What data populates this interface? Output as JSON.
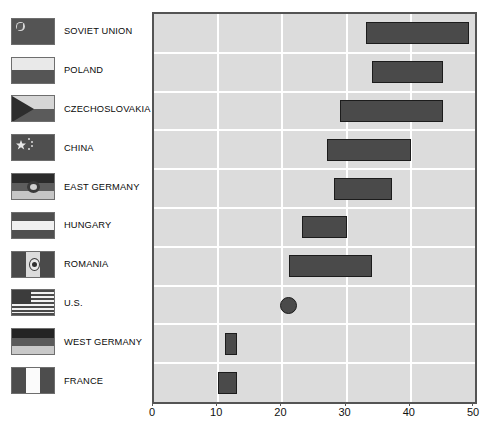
{
  "chart_data": {
    "type": "bar",
    "orientation": "horizontal",
    "title": "",
    "xlabel": "",
    "ylabel": "",
    "xlim": [
      0,
      50
    ],
    "xticks": [
      0,
      10,
      20,
      30,
      40,
      50
    ],
    "xtick_labels": [
      "0",
      "10",
      "20",
      "30",
      "40",
      "50"
    ],
    "grid": true,
    "legend": "none",
    "categories": [
      "SOVIET UNION",
      "POLAND",
      "CZECHOSLOVAKIA",
      "CHINA",
      "EAST GERMANY",
      "HUNGARY",
      "ROMANIA",
      "U.S.",
      "WEST GERMANY",
      "FRANCE"
    ],
    "series": [
      {
        "name": "range",
        "kind": "range-bar",
        "ranges": [
          {
            "category": "SOVIET UNION",
            "low": 33,
            "high": 49,
            "marker": "bar"
          },
          {
            "category": "POLAND",
            "low": 34,
            "high": 45,
            "marker": "bar"
          },
          {
            "category": "CZECHOSLOVAKIA",
            "low": 29,
            "high": 45,
            "marker": "bar"
          },
          {
            "category": "CHINA",
            "low": 27,
            "high": 40,
            "marker": "bar"
          },
          {
            "category": "EAST GERMANY",
            "low": 28,
            "high": 37,
            "marker": "bar"
          },
          {
            "category": "HUNGARY",
            "low": 23,
            "high": 30,
            "marker": "bar"
          },
          {
            "category": "ROMANIA",
            "low": 21,
            "high": 34,
            "marker": "bar"
          },
          {
            "category": "U.S.",
            "low": 21,
            "high": 21,
            "marker": "dot"
          },
          {
            "category": "WEST GERMANY",
            "low": 11,
            "high": 13,
            "marker": "bar"
          },
          {
            "category": "FRANCE",
            "low": 10,
            "high": 13,
            "marker": "bar"
          }
        ]
      }
    ],
    "colors": {
      "bar_fill": "#4a4a4a",
      "bar_border": "#1c1c1c",
      "plot_background": "#dcdcdc",
      "gridline": "#ffffff",
      "frame": "#545454",
      "text": "#111111"
    }
  },
  "legend_rows": [
    {
      "label": "SOVIET UNION",
      "flag": "flag-soviet-union-icon"
    },
    {
      "label": "POLAND",
      "flag": "flag-poland-icon"
    },
    {
      "label": "CZECHOSLOVAKIA",
      "flag": "flag-czechoslovakia-icon"
    },
    {
      "label": "CHINA",
      "flag": "flag-china-icon"
    },
    {
      "label": "EAST GERMANY",
      "flag": "flag-east-germany-icon"
    },
    {
      "label": "HUNGARY",
      "flag": "flag-hungary-icon"
    },
    {
      "label": "ROMANIA",
      "flag": "flag-romania-icon"
    },
    {
      "label": "U.S.",
      "flag": "flag-united-states-icon"
    },
    {
      "label": "WEST GERMANY",
      "flag": "flag-west-germany-icon"
    },
    {
      "label": "FRANCE",
      "flag": "flag-france-icon"
    }
  ]
}
